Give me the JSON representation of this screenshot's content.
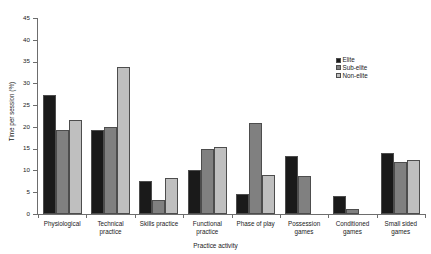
{
  "chart_data": {
    "type": "bar",
    "title": "",
    "subtitle": "",
    "xlabel": "Practice activity",
    "ylabel": "Time per session (%)",
    "ylim": [
      0,
      45
    ],
    "ytick_step": 5,
    "yticks": [
      "0",
      "5",
      "10",
      "15",
      "20",
      "25",
      "30",
      "35",
      "40",
      "45"
    ],
    "grid": false,
    "legend_position": "right",
    "categories": [
      "Physiological",
      "Technical practice",
      "Skills practice",
      "Functional practice",
      "Phase of play",
      "Possession games",
      "Conditioned games",
      "Small sided games"
    ],
    "series": [
      {
        "name": "Elite",
        "color": "#1a1a1a",
        "values": [
          27.4,
          19.2,
          7.5,
          10.0,
          4.6,
          13.4,
          4.2,
          14.0
        ]
      },
      {
        "name": "Sub-elite",
        "color": "#808080",
        "values": [
          19.4,
          20.0,
          3.2,
          15.0,
          20.8,
          8.8,
          1.2,
          12.0
        ]
      },
      {
        "name": "Non-elite",
        "color": "#bfbfbf",
        "values": [
          21.6,
          33.7,
          8.3,
          15.4,
          8.9,
          null,
          null,
          12.4
        ]
      }
    ]
  },
  "legend": {
    "items": [
      {
        "label": "Elite",
        "color": "#1a1a1a"
      },
      {
        "label": "Sub-elite",
        "color": "#808080"
      },
      {
        "label": "Non-elite",
        "color": "#bfbfbf"
      }
    ]
  }
}
